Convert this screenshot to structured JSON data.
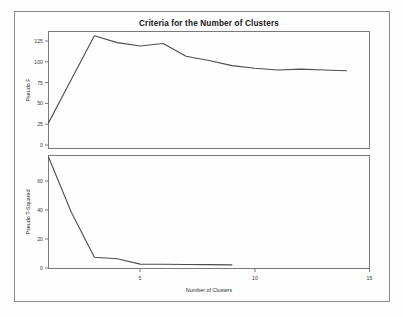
{
  "chart_data": [
    {
      "type": "line",
      "panel": "top",
      "title": "Criteria for the Number of Clusters",
      "xlabel": "",
      "ylabel": "Pseudo F",
      "xlim": [
        1,
        15
      ],
      "ylim": [
        0,
        137
      ],
      "grid": false,
      "legend": null,
      "xticks": [
        5,
        10,
        15
      ],
      "xticklabels": [
        "5",
        "10",
        "15"
      ],
      "yticks": [
        0,
        25,
        50,
        75,
        100,
        125
      ],
      "yticklabels": [
        "0",
        "25",
        "50",
        "75",
        "100",
        "125"
      ],
      "series": [
        {
          "name": "Pseudo F",
          "x": [
            1,
            2,
            3,
            4,
            5,
            6,
            7,
            8,
            9,
            10,
            11,
            12,
            13,
            14
          ],
          "values": [
            30,
            81,
            132,
            124,
            120,
            123,
            108,
            103,
            97,
            94,
            92,
            93,
            92,
            91
          ]
        }
      ]
    },
    {
      "type": "line",
      "panel": "bottom",
      "title": "",
      "xlabel": "Number of Clusters",
      "ylabel": "Pseudo T-Squared",
      "xlim": [
        1,
        15
      ],
      "ylim": [
        0,
        73
      ],
      "grid": false,
      "legend": null,
      "xticks": [
        5,
        10,
        15
      ],
      "xticklabels": [
        "5",
        "10",
        "15"
      ],
      "yticks": [
        0,
        20,
        40,
        60
      ],
      "yticklabels": [
        "0",
        "20",
        "40",
        "60"
      ],
      "series": [
        {
          "name": "Pseudo T-Squared",
          "x": [
            1,
            2,
            3,
            4,
            5,
            6,
            7,
            8,
            9
          ],
          "values": [
            72,
            36,
            7,
            6,
            2.5,
            2.4,
            2.3,
            2.2,
            2.0
          ]
        }
      ]
    }
  ],
  "figure": {
    "title": "Criteria for the Number of Clusters",
    "xlabel": "Number of Clusters",
    "top_ylabel": "Pseudo F",
    "bottom_ylabel": "Pseudo T-Squared",
    "top_yticklabels": [
      "125",
      "100",
      "75",
      "50",
      "25",
      "0"
    ],
    "bottom_yticklabels": [
      "60",
      "40",
      "20",
      "0"
    ],
    "xticklabels": [
      "5",
      "10",
      "15"
    ],
    "colors": {
      "line": "#4d4d4d",
      "axis": "#7a7a7a",
      "frame": "#8c8c8c",
      "background": "#fefefe",
      "text": "#1a1a1a"
    }
  }
}
